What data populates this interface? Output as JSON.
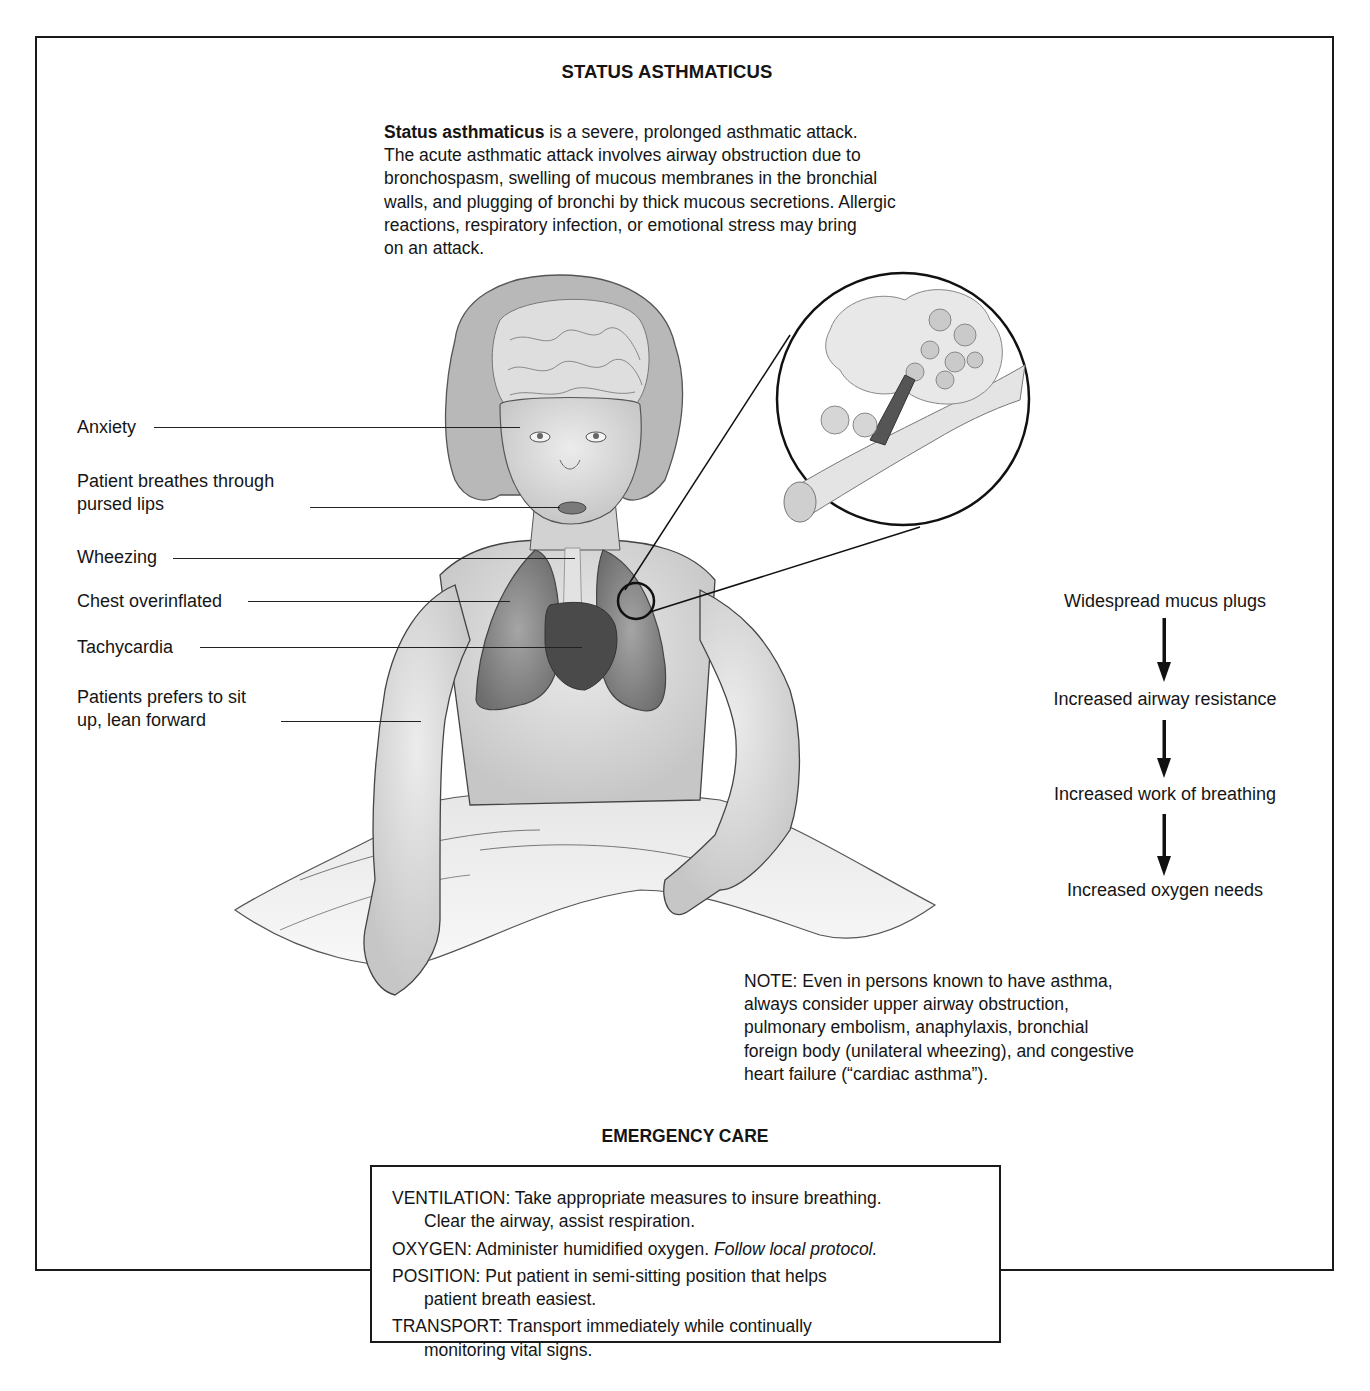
{
  "title": "STATUS ASTHMATICUS",
  "intro": {
    "term": "Status asthmaticus",
    "lines": [
      " is a severe, prolonged asthmatic attack.",
      "The acute asthmatic attack involves airway obstruction due to",
      "bronchospasm, swelling of mucous membranes in the bronchial",
      "walls, and plugging of bronchi by thick mucous secretions. Allergic",
      "reactions, respiratory infection, or emotional stress may bring",
      "on an attack."
    ]
  },
  "labels": [
    {
      "line1": "Anxiety",
      "line2": ""
    },
    {
      "line1": "Patient breathes through",
      "line2": "pursed lips"
    },
    {
      "line1": "Wheezing",
      "line2": ""
    },
    {
      "line1": "Chest overinflated",
      "line2": ""
    },
    {
      "line1": "Tachycardia",
      "line2": ""
    },
    {
      "line1": "Patients prefers to sit",
      "line2": "up, lean forward"
    }
  ],
  "flow": {
    "steps": [
      "Widespread mucus plugs",
      "Increased airway resistance",
      "Increased work of breathing",
      "Increased oxygen needs"
    ],
    "arrow_icon": "down-arrow"
  },
  "note": {
    "lines": [
      "NOTE: Even in persons known to have asthma,",
      "always consider upper airway obstruction,",
      "pulmonary embolism, anaphylaxis, bronchial",
      "foreign body (unilateral wheezing), and congestive",
      "heart failure (“cardiac asthma”)."
    ]
  },
  "emergency_care": {
    "title": "EMERGENCY CARE",
    "items": [
      {
        "lead": "VENTILATION: Take appropriate measures to insure breathing.",
        "cont": "Clear the airway, assist respiration.",
        "italic": ""
      },
      {
        "lead": "OXYGEN: Administer humidified oxygen. ",
        "cont": "",
        "italic": "Follow local protocol."
      },
      {
        "lead": "POSITION: Put patient in semi-sitting position that helps",
        "cont": "patient breath easiest.",
        "italic": ""
      },
      {
        "lead": "TRANSPORT: Transport immediately while continually",
        "cont": "monitoring vital signs.",
        "italic": ""
      }
    ]
  },
  "illustration": {
    "subject": "child-sitting-upright-illustration",
    "inset": "bronchiole-mucus-plug-inset",
    "colors": {
      "ink": "#1a1a1a",
      "skin": "#d9d9d9",
      "lung": "#8c8c8c",
      "heart": "#4a4a4a",
      "sheet": "#ececec"
    }
  }
}
